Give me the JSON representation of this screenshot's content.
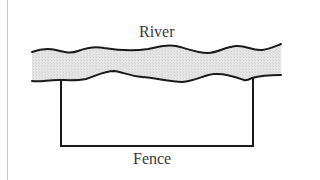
{
  "diagram": {
    "labels": {
      "river": "River",
      "fence": "Fence"
    },
    "colors": {
      "river_fill": "#e2e2e2",
      "stroke": "#1a1a1a",
      "label": "#3a3a3a",
      "frame_border": "#c8c8c8"
    },
    "elements": [
      {
        "id": "river",
        "type": "wavy-band",
        "label": "River"
      },
      {
        "id": "fence",
        "type": "three-sided-rectangle",
        "label": "Fence",
        "open_side": "top (river bank)"
      }
    ]
  }
}
